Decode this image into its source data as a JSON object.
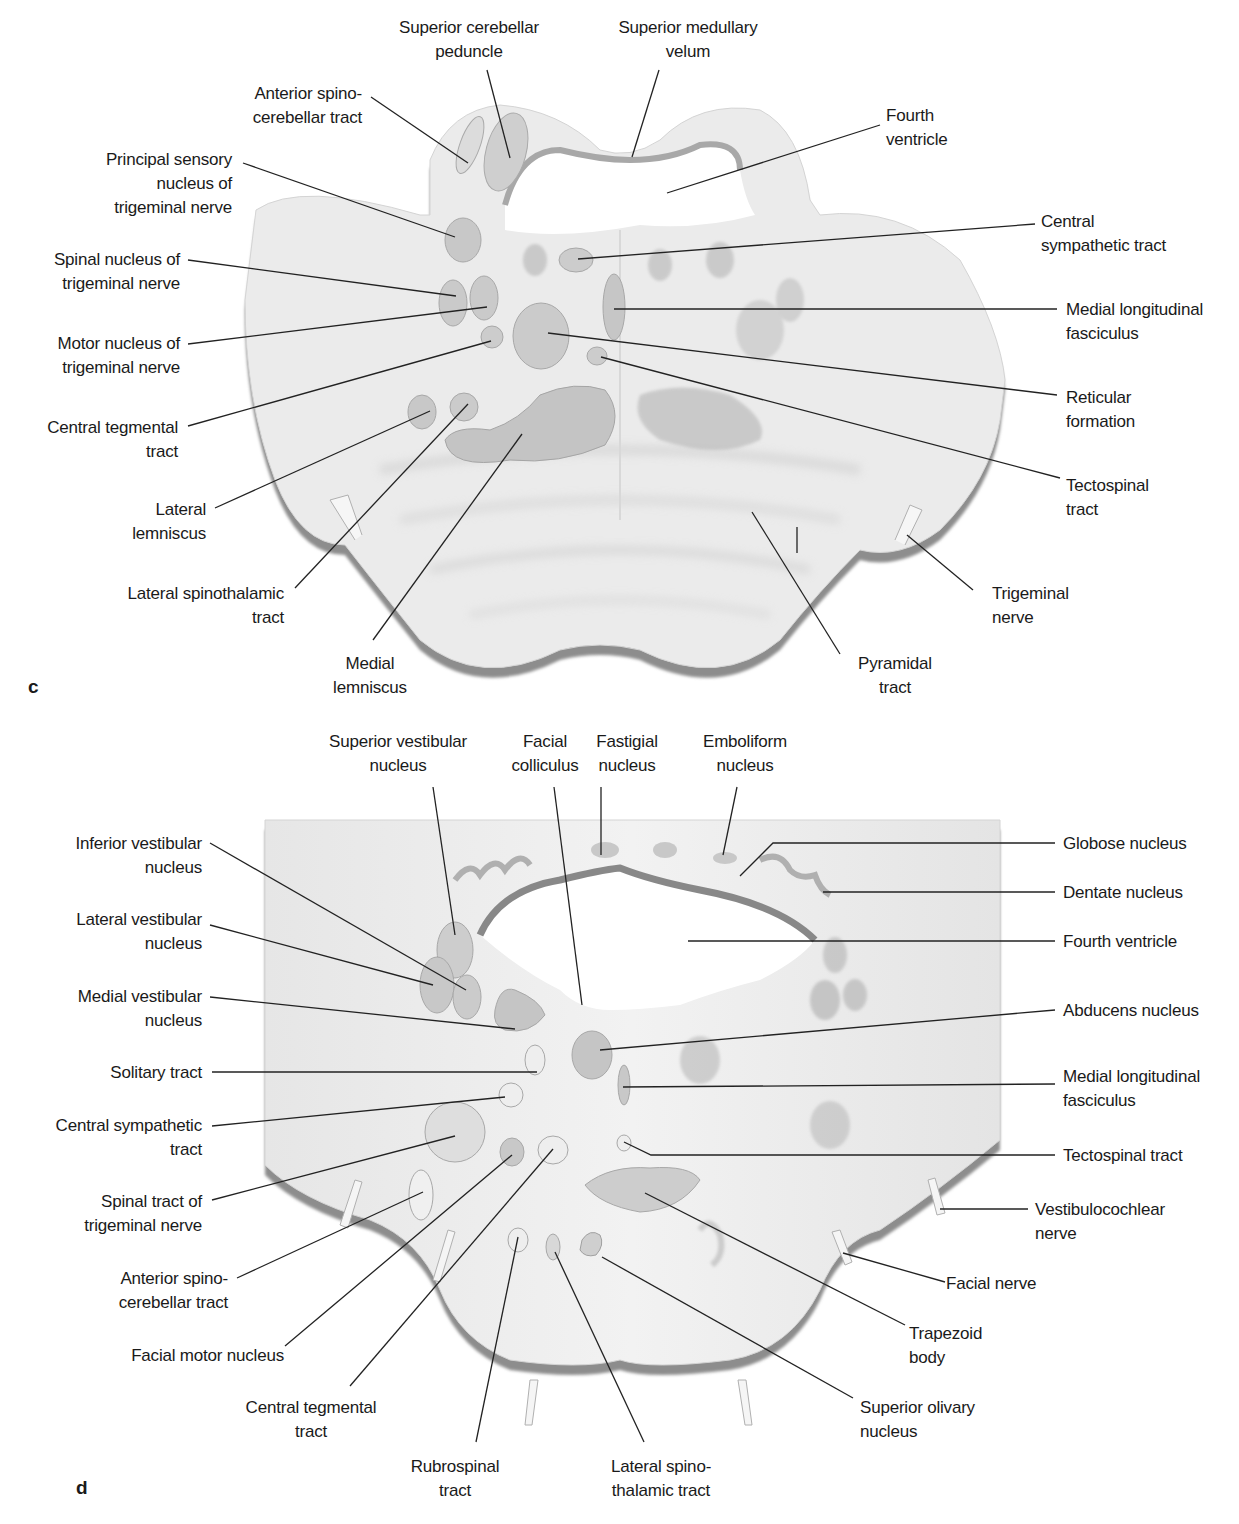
{
  "panels": [
    {
      "id": "c",
      "letter": "c",
      "title": "Cross-section of the pons (upper level)",
      "labels": {
        "superior_cerebellar_peduncle": [
          "Superior cerebellar",
          "peduncle"
        ],
        "superior_medullary_velum": [
          "Superior medullary",
          "velum"
        ],
        "anterior_spinocerebellar_tract": [
          "Anterior spino-",
          "cerebellar tract"
        ],
        "fourth_ventricle": [
          "Fourth",
          "ventricle"
        ],
        "principal_sensory_nucleus": [
          "Principal sensory",
          "nucleus of",
          "trigeminal nerve"
        ],
        "central_sympathetic_tract": [
          "Central",
          "sympathetic tract"
        ],
        "spinal_nucleus_trigeminal": [
          "Spinal nucleus of",
          "trigeminal nerve"
        ],
        "medial_longitudinal_fasciculus": [
          "Medial longitudinal",
          "fasciculus"
        ],
        "motor_nucleus_trigeminal": [
          "Motor nucleus of",
          "trigeminal nerve"
        ],
        "reticular_formation": [
          "Reticular",
          "formation"
        ],
        "central_tegmental_tract": [
          "Central tegmental",
          "tract"
        ],
        "tectospinal_tract": [
          "Tectospinal",
          "tract"
        ],
        "lateral_lemniscus": [
          "Lateral",
          "lemniscus"
        ],
        "lateral_spinothalamic_tract": [
          "Lateral spinothalamic",
          "tract"
        ],
        "trigeminal_nerve": [
          "Trigeminal",
          "nerve"
        ],
        "medial_lemniscus": [
          "Medial",
          "lemniscus"
        ],
        "pyramidal_tract": [
          "Pyramidal",
          "tract"
        ]
      }
    },
    {
      "id": "d",
      "letter": "d",
      "title": "Cross-section of the pons (lower level)",
      "labels": {
        "superior_vestibular_nucleus": [
          "Superior vestibular",
          "nucleus"
        ],
        "facial_colliculus": [
          "Facial",
          "colliculus"
        ],
        "fastigial_nucleus": [
          "Fastigial",
          "nucleus"
        ],
        "emboliform_nucleus": [
          "Emboliform",
          "nucleus"
        ],
        "inferior_vestibular_nucleus": [
          "Inferior vestibular",
          "nucleus"
        ],
        "globose_nucleus": [
          "Globose nucleus"
        ],
        "dentate_nucleus": [
          "Dentate nucleus"
        ],
        "lateral_vestibular_nucleus": [
          "Lateral vestibular",
          "nucleus"
        ],
        "fourth_ventricle": [
          "Fourth ventricle"
        ],
        "medial_vestibular_nucleus": [
          "Medial vestibular",
          "nucleus"
        ],
        "abducens_nucleus": [
          "Abducens nucleus"
        ],
        "solitary_tract": [
          "Solitary tract"
        ],
        "medial_longitudinal_fasciculus": [
          "Medial longitudinal",
          "fasciculus"
        ],
        "central_sympathetic_tract": [
          "Central sympathetic",
          "tract"
        ],
        "tectospinal_tract": [
          "Tectospinal tract"
        ],
        "spinal_tract_trigeminal": [
          "Spinal tract of",
          "trigeminal nerve"
        ],
        "vestibulocochlear_nerve": [
          "Vestibulocochlear",
          "nerve"
        ],
        "anterior_spinocerebellar_tract": [
          "Anterior spino-",
          "cerebellar tract"
        ],
        "facial_nerve": [
          "Facial nerve"
        ],
        "facial_motor_nucleus": [
          "Facial motor nucleus"
        ],
        "trapezoid_body": [
          "Trapezoid",
          "body"
        ],
        "central_tegmental_tract": [
          "Central tegmental",
          "tract"
        ],
        "superior_olivary_nucleus": [
          "Superior olivary",
          "nucleus"
        ],
        "rubrospinal_tract": [
          "Rubrospinal",
          "tract"
        ],
        "lateral_spinothalamic_tract": [
          "Lateral spino-",
          "thalamic tract"
        ]
      }
    }
  ],
  "colors": {
    "tissue": "#ececec",
    "tissue_light": "#f4f4f4",
    "nucleus": "#c9c9c9",
    "nucleus_dark": "#b4b4b4",
    "edge_shadow": "#8a8a8a",
    "leader_line": "#222222",
    "text": "#1a1a1a"
  }
}
